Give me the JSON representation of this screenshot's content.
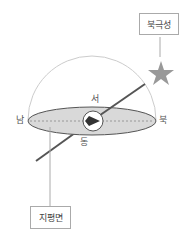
{
  "diagram": {
    "labels": {
      "polaris": "북극성",
      "horizon_plane": "지평면",
      "west": "서",
      "east": "동",
      "south": "남",
      "north": "북"
    },
    "colors": {
      "plane_fill": "#d9d9d9",
      "plane_stroke": "#555555",
      "axis_line": "#555555",
      "star": "#999999",
      "dome": "#cccccc",
      "leader": "#aaaaaa"
    }
  }
}
